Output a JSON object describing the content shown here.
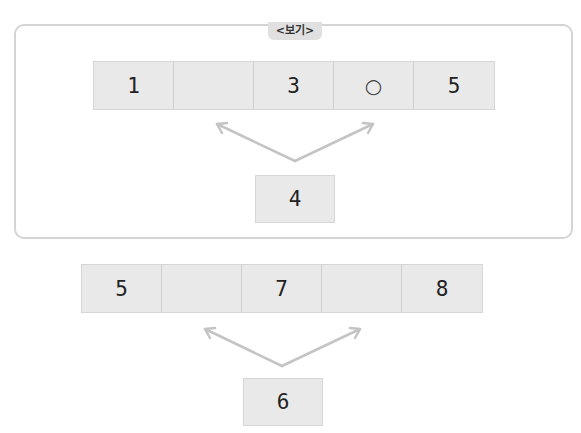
{
  "example_panel": {
    "tag_label": "<보기>",
    "row_cells": [
      "1",
      "",
      "3",
      "○",
      "5"
    ],
    "source_box": "4"
  },
  "problem": {
    "row_cells": [
      "5",
      "",
      "7",
      "",
      "8"
    ],
    "source_box": "6"
  },
  "colors": {
    "cell_fill": "#e9e9e9",
    "panel_border": "#d4d4d4",
    "arrow": "#c4c4c4"
  }
}
